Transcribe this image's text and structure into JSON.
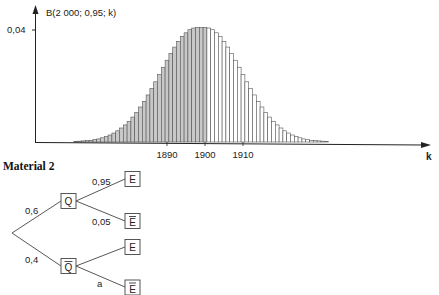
{
  "chart_data": {
    "type": "bar",
    "title": "B(2 000; 0,95; k)",
    "xlabel": "k",
    "ylabel": "B(2 000; 0,95; k)",
    "y_ticks": [
      {
        "value": 0.04,
        "label": "0,04"
      }
    ],
    "x_ticks": [
      {
        "value": 1890,
        "label": "1890"
      },
      {
        "value": 1900,
        "label": "1900"
      },
      {
        "value": 1910,
        "label": "1910"
      }
    ],
    "distribution": {
      "n": 2000,
      "p": 0.95
    },
    "shaded_up_to_k": 1900,
    "x": [
      1862,
      1863,
      1864,
      1865,
      1866,
      1867,
      1868,
      1869,
      1870,
      1871,
      1872,
      1873,
      1874,
      1875,
      1876,
      1877,
      1878,
      1879,
      1880,
      1881,
      1882,
      1883,
      1884,
      1885,
      1886,
      1887,
      1888,
      1889,
      1890,
      1891,
      1892,
      1893,
      1894,
      1895,
      1896,
      1897,
      1898,
      1899,
      1900,
      1901,
      1902,
      1903,
      1904,
      1905,
      1906,
      1907,
      1908,
      1909,
      1910,
      1911,
      1912,
      1913,
      1914,
      1915,
      1916,
      1917,
      1918,
      1919,
      1920,
      1921,
      1922,
      1923,
      1924,
      1925,
      1926,
      1927,
      1928,
      1929,
      1930,
      1931,
      1932,
      1933,
      1934,
      1935,
      1936,
      1937,
      1938
    ],
    "values": [
      0.0001,
      0.0001,
      0.0001,
      0.0001,
      0.0002,
      0.0003,
      0.0004,
      0.0005,
      0.0006,
      0.0009,
      0.0011,
      0.0015,
      0.0019,
      0.0025,
      0.0032,
      0.004,
      0.005,
      0.0061,
      0.0074,
      0.0089,
      0.0106,
      0.0125,
      0.0145,
      0.0168,
      0.0191,
      0.0215,
      0.0241,
      0.0267,
      0.0292,
      0.0316,
      0.0339,
      0.0359,
      0.0377,
      0.039,
      0.0401,
      0.0407,
      0.0409,
      0.0409,
      0.0409,
      0.0407,
      0.0401,
      0.039,
      0.0377,
      0.0359,
      0.0339,
      0.0316,
      0.0292,
      0.0267,
      0.0241,
      0.0215,
      0.0191,
      0.0168,
      0.0145,
      0.0125,
      0.0106,
      0.0089,
      0.0074,
      0.0061,
      0.005,
      0.004,
      0.0032,
      0.0025,
      0.0019,
      0.0015,
      0.0011,
      0.0009,
      0.0006,
      0.0005,
      0.0004,
      0.0003,
      0.0002,
      0.0001,
      0.0001,
      0.0001,
      0.0001,
      0.0,
      0.0
    ],
    "ylim": [
      0,
      0.045
    ],
    "grid": false,
    "legend": null
  },
  "material": {
    "heading": "Material 2"
  },
  "tree": {
    "root_branches": [
      {
        "prob": "0,6",
        "node": "Q",
        "bar": false
      },
      {
        "prob": "0,4",
        "node": "Q",
        "bar": true
      }
    ],
    "leaves": [
      {
        "parent": "Q",
        "prob": "0,95",
        "node": "E",
        "bar": false
      },
      {
        "parent": "Q",
        "prob": "0,05",
        "node": "E",
        "bar": true
      },
      {
        "parent": "Q-bar",
        "prob": "",
        "node": "E",
        "bar": false
      },
      {
        "parent": "Q-bar",
        "prob": "a",
        "node": "E",
        "bar": true
      }
    ]
  },
  "colors": {
    "axis": "#222222",
    "bar_stroke": "#555555",
    "bar_fill_shaded": "#c8c8c8",
    "bar_fill_plain": "#ffffff"
  }
}
